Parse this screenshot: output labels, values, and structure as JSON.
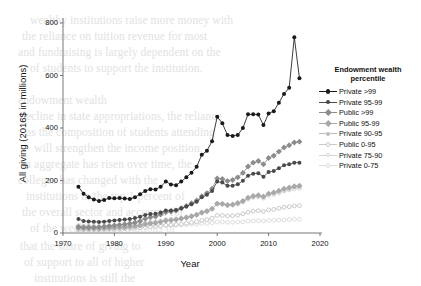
{
  "chart_data": {
    "type": "line",
    "title": "",
    "xlabel": "Year",
    "ylabel": "All giving (2016$ in millions)",
    "xlim": [
      1970,
      2020
    ],
    "ylim": [
      0,
      800
    ],
    "xticks": [
      1970,
      1980,
      1990,
      2000,
      2010,
      2020
    ],
    "yticks": [
      0,
      200,
      400,
      600,
      800
    ],
    "grid": false,
    "legend_position": "right",
    "legend_title": "Endowment wealth percentile",
    "x": [
      1973,
      1974,
      1975,
      1976,
      1977,
      1978,
      1979,
      1980,
      1981,
      1982,
      1983,
      1984,
      1985,
      1986,
      1987,
      1988,
      1989,
      1990,
      1991,
      1992,
      1993,
      1994,
      1995,
      1996,
      1997,
      1998,
      1999,
      2000,
      2001,
      2002,
      2003,
      2004,
      2005,
      2006,
      2007,
      2008,
      2009,
      2010,
      2011,
      2012,
      2013,
      2014,
      2015,
      2016
    ],
    "series": [
      {
        "name": "Private >99",
        "color": "#1a1a1a",
        "marker": "filled-circle",
        "values": [
          176,
          150,
          136,
          128,
          122,
          126,
          133,
          132,
          133,
          131,
          130,
          136,
          148,
          160,
          167,
          166,
          176,
          196,
          185,
          182,
          196,
          212,
          230,
          252,
          298,
          313,
          350,
          443,
          418,
          373,
          370,
          373,
          400,
          452,
          452,
          451,
          411,
          455,
          464,
          496,
          530,
          553,
          746,
          590
        ]
      },
      {
        "name": "Private 95-99",
        "color": "#4a4a4a",
        "marker": "filled-circle",
        "values": [
          53,
          46,
          44,
          43,
          42,
          43,
          46,
          48,
          50,
          51,
          53,
          57,
          62,
          69,
          72,
          73,
          78,
          86,
          86,
          88,
          94,
          101,
          110,
          119,
          136,
          146,
          160,
          196,
          192,
          180,
          180,
          186,
          199,
          218,
          226,
          228,
          214,
          232,
          236,
          247,
          258,
          262,
          268,
          268
        ]
      },
      {
        "name": "Public >99",
        "color": "#8c8c8c",
        "marker": "filled-diamond",
        "values": [
          24,
          22,
          22,
          22,
          23,
          25,
          27,
          29,
          31,
          33,
          36,
          40,
          46,
          54,
          60,
          63,
          70,
          79,
          82,
          86,
          94,
          103,
          113,
          124,
          140,
          152,
          169,
          208,
          206,
          198,
          202,
          212,
          229,
          253,
          268,
          274,
          262,
          286,
          294,
          310,
          326,
          334,
          345,
          348
        ]
      },
      {
        "name": "Public 95-99",
        "color": "#a8a8a8",
        "marker": "filled-diamond",
        "values": [
          18,
          17,
          17,
          17,
          17,
          18,
          19,
          20,
          21,
          22,
          24,
          26,
          29,
          33,
          36,
          38,
          42,
          47,
          48,
          50,
          54,
          58,
          63,
          69,
          77,
          83,
          92,
          112,
          111,
          107,
          109,
          114,
          122,
          134,
          141,
          144,
          139,
          150,
          154,
          161,
          169,
          173,
          178,
          180
        ]
      },
      {
        "name": "Private 90-95",
        "color": "#bdbdbd",
        "marker": "filled-circle",
        "values": [
          20,
          19,
          18,
          18,
          18,
          19,
          20,
          21,
          22,
          23,
          25,
          27,
          30,
          34,
          37,
          39,
          43,
          48,
          49,
          51,
          55,
          59,
          64,
          70,
          78,
          84,
          92,
          112,
          111,
          107,
          108,
          113,
          121,
          133,
          139,
          142,
          137,
          148,
          151,
          158,
          165,
          169,
          174,
          176
        ]
      },
      {
        "name": "Public 0-95",
        "color": "#c9c9c9",
        "marker": "open-circle",
        "values": [
          12,
          12,
          12,
          12,
          12,
          13,
          13,
          14,
          15,
          16,
          17,
          18,
          20,
          22,
          24,
          25,
          27,
          30,
          31,
          32,
          34,
          37,
          40,
          43,
          48,
          51,
          56,
          67,
          67,
          65,
          66,
          68,
          73,
          79,
          83,
          85,
          82,
          88,
          90,
          94,
          98,
          100,
          103,
          104
        ]
      },
      {
        "name": "Private 75-90",
        "color": "#d4d4d4",
        "marker": "open-circle",
        "values": [
          28,
          27,
          26,
          25,
          24,
          25,
          26,
          27,
          28,
          29,
          30,
          32,
          35,
          38,
          41,
          43,
          46,
          51,
          52,
          54,
          57,
          61,
          66,
          71,
          79,
          84,
          92,
          110,
          109,
          105,
          106,
          110,
          118,
          129,
          135,
          138,
          133,
          143,
          147,
          153,
          160,
          164,
          168,
          170
        ]
      },
      {
        "name": "Private 0-75",
        "color": "#dedede",
        "marker": "open-circle",
        "values": [
          20,
          20,
          20,
          20,
          20,
          20,
          21,
          21,
          22,
          22,
          23,
          23,
          24,
          25,
          26,
          27,
          28,
          29,
          30,
          30,
          31,
          32,
          33,
          34,
          36,
          37,
          39,
          42,
          42,
          41,
          41,
          42,
          43,
          45,
          46,
          47,
          46,
          48,
          48,
          49,
          50,
          51,
          52,
          52
        ]
      }
    ]
  },
  "legend": {
    "title_line1": "Endowment wealth",
    "title_line2": "percentile",
    "items": [
      {
        "label": "Private >99"
      },
      {
        "label": "Private 95-99"
      },
      {
        "label": "Public >99"
      },
      {
        "label": "Public 95-99"
      },
      {
        "label": "Private 90-95"
      },
      {
        "label": "Public 0-95"
      },
      {
        "label": "Private 75-90"
      },
      {
        "label": "Private 0-75"
      }
    ]
  },
  "axes": {
    "x_title": "Year",
    "y_title": "All giving (2016$ in millions)",
    "x_tick_labels": [
      "1970",
      "1980",
      "1990",
      "2000",
      "2010",
      "2020"
    ],
    "y_tick_labels": [
      "0",
      "200",
      "400",
      "600",
      "800"
    ]
  },
  "background_text": {
    "lines": [
      "wealthy institutions raise more money with",
      "the reliance on tuition revenue for most",
      "and fundraising is largely dependent on the",
      "of students to support the institution.",
      "decline in state appropriations, the reliance",
      "as the composition of students attending",
      "will strengthen the income position.",
      "in aggregate has risen over time, the",
      "colleges has changed with the",
      "institutions in the top 1 percent of",
      "the overall sector and accounts for",
      "of the wealthiest institutions of",
      "that the share of giving to",
      "of support to all of higher",
      "institutions is still the",
      "endowment wealth"
    ]
  }
}
